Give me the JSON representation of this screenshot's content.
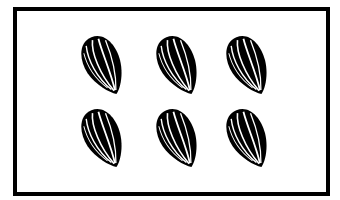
{
  "figure": {
    "count": 6,
    "rows": 2,
    "columns": 3,
    "item_name": "sunflower seed"
  },
  "colors": {
    "ink": "#000000",
    "background": "#ffffff"
  },
  "seeds": [
    {
      "x": 79,
      "y": 33
    },
    {
      "x": 154,
      "y": 33
    },
    {
      "x": 224,
      "y": 33
    },
    {
      "x": 79,
      "y": 106
    },
    {
      "x": 154,
      "y": 106
    },
    {
      "x": 224,
      "y": 106
    }
  ]
}
